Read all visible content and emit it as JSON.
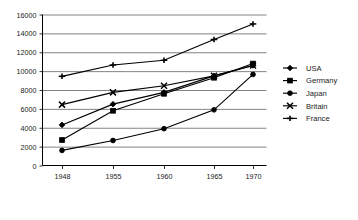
{
  "chart_data": {
    "type": "line",
    "title": "",
    "subtitle": "",
    "xlabel": "",
    "ylabel": "",
    "categories": [
      "1948",
      "1955",
      "1960",
      "1965",
      "1970"
    ],
    "ylim": [
      0,
      16000
    ],
    "ytick_values": [
      0,
      2000,
      4000,
      6000,
      8000,
      10000,
      12000,
      14000,
      16000
    ],
    "ytick_labels": [
      "0",
      "2000",
      "4000",
      "6000",
      "8000",
      "10000",
      "12000",
      "14000",
      "16000"
    ],
    "xtick_labels": [
      "1948",
      "1955",
      "1960",
      "1965",
      "1970"
    ],
    "grid": true,
    "grid_axis": "y",
    "legend_position": "right",
    "series": [
      {
        "name": "USA",
        "marker": "diamond",
        "color": "#000000",
        "values": [
          4300,
          6500,
          7750,
          9500,
          10600
        ]
      },
      {
        "name": "Germany",
        "marker": "square",
        "color": "#000000",
        "values": [
          2700,
          5800,
          7600,
          9300,
          10800
        ]
      },
      {
        "name": "Japan",
        "marker": "circle",
        "color": "#000000",
        "values": [
          1600,
          2650,
          3900,
          5900,
          9650
        ]
      },
      {
        "name": "Britain",
        "marker": "cross",
        "color": "#000000",
        "values": [
          6450,
          7750,
          8450,
          9500,
          10600
        ]
      },
      {
        "name": "France",
        "marker": "plus",
        "color": "#000000",
        "values": [
          9450,
          10650,
          11150,
          13350,
          15000
        ]
      }
    ]
  },
  "legend": {
    "items": [
      {
        "label": "USA"
      },
      {
        "label": "Germany"
      },
      {
        "label": "Japan"
      },
      {
        "label": "Britain"
      },
      {
        "label": "France"
      }
    ]
  },
  "axes": {
    "y_labels": [
      "16000",
      "14000",
      "12000",
      "10000",
      "8000",
      "6000",
      "4000",
      "2000",
      "0"
    ],
    "x_labels": [
      "1948",
      "1955",
      "1960",
      "1965",
      "1970"
    ]
  },
  "colors": {
    "ink": "#000000",
    "grid": "#4d4d4d",
    "background": "#ffffff"
  }
}
